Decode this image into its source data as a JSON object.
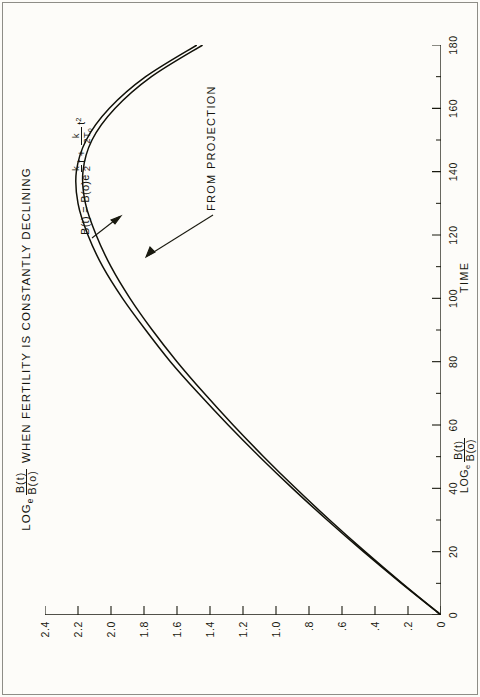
{
  "chart_data": {
    "type": "line",
    "title_parts": {
      "log_prefix": "LOG",
      "log_sub": "e",
      "frac_num": "B(t)",
      "frac_den": "B(o)",
      "rest": "WHEN  FERTILITY  IS  CONSTANTLY  DECLINING"
    },
    "xlabel": "TIME",
    "ylabel": "LOGe B(t)/B(o)",
    "ylabel_parts": {
      "log_prefix": "LOG",
      "log_sub": "e",
      "frac_num": "B(t)",
      "frac_den": "B(o)"
    },
    "xlim": [
      0,
      180
    ],
    "ylim": [
      0,
      2.4
    ],
    "xticks": [
      0,
      20,
      40,
      60,
      80,
      100,
      120,
      140,
      160,
      180
    ],
    "xtick_labels": [
      "0",
      "20",
      "40",
      "60",
      "80",
      "100",
      "120",
      "140",
      "160",
      "180"
    ],
    "x_minor_step": 10,
    "yticks": [
      0,
      0.2,
      0.4,
      0.6,
      0.8,
      1.0,
      1.2,
      1.4,
      1.6,
      1.8,
      2.0,
      2.2,
      2.4
    ],
    "ytick_labels": [
      "0",
      ".2",
      ".4",
      ".6",
      ".8",
      "1.0",
      "1.2",
      "1.4",
      "1.6",
      "1.8",
      "2.0",
      "2.2",
      "2.4"
    ],
    "grid": false,
    "legend": "none",
    "series": [
      {
        "name": "B(t) = B(o)e^(k/2 t + k/2To t^2)",
        "x": [
          0,
          10,
          20,
          30,
          40,
          50,
          60,
          70,
          80,
          90,
          100,
          110,
          120,
          130,
          140,
          150,
          160,
          170,
          180
        ],
        "values": [
          0.0,
          0.24,
          0.47,
          0.69,
          0.9,
          1.1,
          1.29,
          1.47,
          1.64,
          1.79,
          1.93,
          2.05,
          2.14,
          2.2,
          2.21,
          2.15,
          2.01,
          1.79,
          1.48
        ]
      },
      {
        "name": "FROM PROJECTION",
        "x": [
          0,
          10,
          20,
          30,
          40,
          50,
          60,
          70,
          80,
          90,
          100,
          110,
          120,
          130,
          140,
          150,
          160,
          170,
          180
        ],
        "values": [
          0.0,
          0.235,
          0.46,
          0.675,
          0.88,
          1.075,
          1.26,
          1.435,
          1.6,
          1.75,
          1.885,
          2.0,
          2.09,
          2.155,
          2.17,
          2.115,
          1.975,
          1.755,
          1.445
        ]
      }
    ],
    "annotations": [
      {
        "id": "equation",
        "text": "B(t) = B(o)e^(k/2 t + k/(2To) t^2)",
        "parts": {
          "lead": "B(t) = B(o)e",
          "exp_frac1_num": "k",
          "exp_frac1_den": "2",
          "exp_t1": "t",
          "exp_plus": "+",
          "exp_frac2_num": "k",
          "exp_frac2_den_pre": "2T",
          "exp_frac2_den_sub": "o",
          "exp_t2": "t",
          "exp_t2_sup": "2"
        }
      },
      {
        "id": "from-projection",
        "text": "FROM  PROJECTION"
      }
    ]
  },
  "colors": {
    "paper": "#fdfcf9",
    "ink": "#19190f",
    "border": "#8e8d87",
    "curve": "#111109"
  }
}
